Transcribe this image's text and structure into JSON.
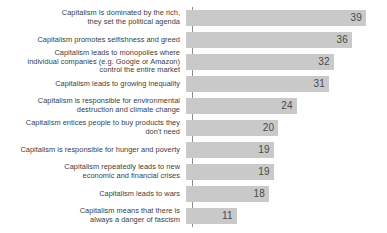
{
  "chart_data": {
    "type": "bar",
    "orientation": "horizontal",
    "title": "",
    "subtitle": "",
    "xlabel": "",
    "ylabel": "",
    "grid": false,
    "legend": null,
    "legend_position": "none",
    "xlim": [
      0,
      39
    ],
    "bar_color": "#c9c9c9",
    "value_label_color": "#4a4a4a",
    "category_label_color": "#3d3d3d",
    "axis_color": "#8c8c8c",
    "categories": [
      "Capitalism Is dominated by the rich,\nthey set the political agenda",
      "Capitalism promotes selfishness and greed",
      "Capitalism leads to monopolies where\nindividual companies (e.g. Google or Amazon)\ncontrol the entire market",
      "Capitalism leads to growing inequality",
      "Capitalism is responsible for environmental\ndestruction and climate change",
      "Capitalism entices people to buy products they\ndon't need",
      "Capitalism is responsible for hunger and poverty",
      "Capitalism repeatedly leads to new\neconomic and financial crises",
      "Capitalism leads to wars",
      "Capitalism means that there is\nalways a danger of fascism"
    ],
    "values": [
      39,
      36,
      32,
      31,
      24,
      20,
      19,
      19,
      18,
      11
    ],
    "value_labels": [
      "39",
      "36",
      "32",
      "31",
      "24",
      "20",
      "19",
      "19",
      "18",
      "11"
    ]
  }
}
